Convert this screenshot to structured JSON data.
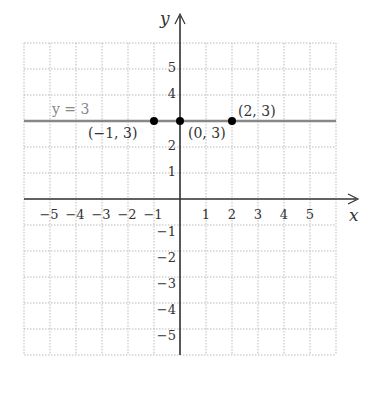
{
  "chart_data": {
    "type": "line",
    "title": "",
    "xlabel": "x",
    "ylabel": "y",
    "xlim": [
      -6,
      6
    ],
    "ylim": [
      -6,
      6
    ],
    "grid": true,
    "x_ticks": [
      -5,
      -4,
      -3,
      -2,
      -1,
      1,
      2,
      3,
      4,
      5
    ],
    "y_ticks": [
      -5,
      -4,
      -3,
      -2,
      -1,
      1,
      2,
      4,
      5
    ],
    "x_tick_labels": [
      "−5",
      "−4",
      "−3",
      "−2",
      "−1",
      "1",
      "2",
      "3",
      "4",
      "5"
    ],
    "y_tick_labels": [
      "−5",
      "−4",
      "−3",
      "−2",
      "−1",
      "1",
      "2",
      "4",
      "5"
    ],
    "series": [
      {
        "name": "y = 3",
        "kind": "horizontal-line",
        "y": 3,
        "color": "#888888",
        "label": "y = 3"
      }
    ],
    "points": [
      {
        "x": -1,
        "y": 3,
        "label": "(−1, 3)"
      },
      {
        "x": 0,
        "y": 3,
        "label": "(0, 3)"
      },
      {
        "x": 2,
        "y": 3,
        "label": "(2, 3)"
      }
    ],
    "colors": {
      "axis": "#333333",
      "grid": "#bbbbbb",
      "line": "#888888",
      "point": "#000000"
    }
  }
}
